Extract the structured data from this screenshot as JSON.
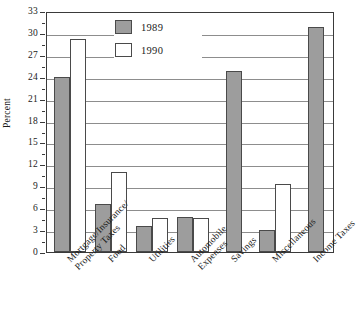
{
  "chart_data": {
    "type": "bar",
    "title": "",
    "xlabel": "",
    "ylabel": "Percent",
    "ylim": [
      0,
      33
    ],
    "ytick_step": 3,
    "yticks": [
      0,
      3,
      6,
      9,
      12,
      15,
      18,
      21,
      24,
      27,
      30,
      33
    ],
    "grid": true,
    "legend_position": "top-center",
    "categories": [
      "Mortgage/Insurance/\nProperty Taxes",
      "Food",
      "Utilities",
      "Automobile\nExpenses",
      "Savings",
      "Miscellaneous",
      "Income Taxes"
    ],
    "series": [
      {
        "name": "1989",
        "color": "#9d9d9d",
        "values": [
          24.0,
          6.6,
          3.6,
          4.8,
          24.8,
          3.0,
          30.8
        ]
      },
      {
        "name": "1990",
        "color": "#ffffff",
        "values": [
          29.2,
          11.0,
          4.7,
          4.7,
          0.0,
          9.3,
          0.0
        ]
      }
    ]
  },
  "axis": {
    "y_label": "Percent",
    "y_ticks": [
      "0",
      "3",
      "6",
      "9",
      "12",
      "15",
      "18",
      "21",
      "24",
      "27",
      "30",
      "33"
    ]
  },
  "legend": {
    "items": [
      {
        "label": "1989",
        "swatch": "gray-swatch"
      },
      {
        "label": "1990",
        "swatch": "white-swatch"
      }
    ]
  }
}
